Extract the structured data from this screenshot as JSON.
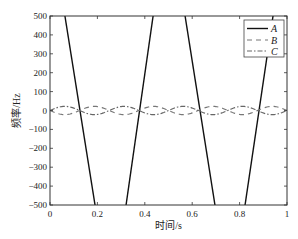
{
  "chart_data": {
    "type": "line",
    "title": "",
    "xlabel": "时间/s",
    "ylabel": "频率/Hz",
    "xlim": [
      0,
      1
    ],
    "ylim": [
      -500,
      500
    ],
    "xticks": [
      0,
      0.2,
      0.4,
      0.6,
      0.8,
      1
    ],
    "xtick_labels": [
      "0",
      "0.2",
      "0.4",
      "0.6",
      "0.8",
      "1"
    ],
    "yticks": [
      500,
      400,
      300,
      200,
      100,
      0,
      -100,
      -200,
      -300,
      -400,
      -500
    ],
    "ytick_labels": [
      "500",
      "400",
      "300",
      "200",
      "100",
      "0",
      "−100",
      "−200",
      "−300",
      "−400",
      "−500"
    ],
    "grid": false,
    "legend_position": "upper right",
    "series": [
      {
        "name": "A",
        "style": "solid",
        "color": "#111111",
        "description": "Steep triangular sweep; lines exit plot bounds",
        "segments": [
          [
            [
              0.063,
              500
            ],
            [
              0.19,
              -500
            ]
          ],
          [
            [
              0.321,
              -500
            ],
            [
              0.435,
              500
            ]
          ],
          [
            [
              0.57,
              500
            ],
            [
              0.696,
              -500
            ]
          ],
          [
            [
              0.823,
              -500
            ],
            [
              0.941,
              500
            ]
          ]
        ]
      },
      {
        "name": "B",
        "style": "dashed",
        "color": "#777777",
        "amplitude": -22,
        "period": 0.25,
        "description": "Small sinusoid around 0, starts going negative"
      },
      {
        "name": "C",
        "style": "dashdot",
        "color": "#666666",
        "amplitude": 22,
        "period": 0.25,
        "description": "Small sinusoid around 0, starts going positive"
      }
    ]
  },
  "legend": {
    "items": [
      {
        "label": "A"
      },
      {
        "label": "B"
      },
      {
        "label": "C"
      }
    ]
  },
  "axes": {
    "xlabel": "时间/s",
    "ylabel": "频率/Hz"
  }
}
